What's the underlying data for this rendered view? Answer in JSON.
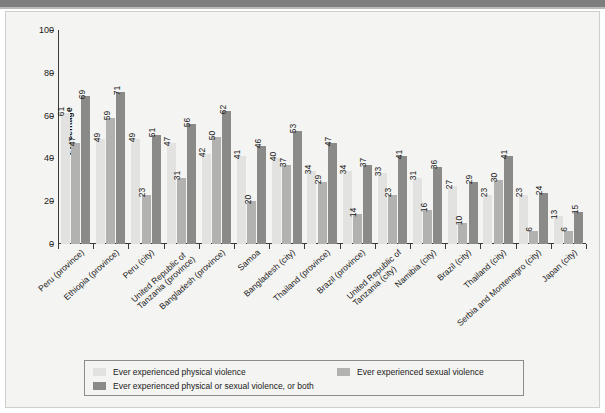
{
  "chart_data": {
    "type": "bar",
    "title": "",
    "subtitle": "",
    "xlabel": "",
    "ylabel": "Percentage",
    "ylim": [
      0,
      100
    ],
    "yticks": [
      0,
      20,
      40,
      60,
      80,
      100
    ],
    "grid": false,
    "legend_position": "bottom",
    "categories": [
      "Peru (province)",
      "Ethiopia (province)",
      "Peru (city)",
      "United Republic of\nTanzania (province)",
      "Bangladesh (province)",
      "Samoa",
      "Bangladesh (city)",
      "Thailand (province)",
      "Brazil (province)",
      "United Republic of\nTanzania (city)",
      "Namibia (city)",
      "Brazil (city)",
      "Thailand (city)",
      "Serbia and Montenegro (city)",
      "Japan (city)"
    ],
    "series": [
      {
        "name": "Ever experienced physical violence",
        "color": "#e2e2e0",
        "values": [
          61,
          49,
          49,
          47,
          42,
          41,
          40,
          34,
          34,
          33,
          31,
          27,
          23,
          23,
          13
        ]
      },
      {
        "name": "Ever experienced sexual violence",
        "color": "#b2b2b0",
        "values": [
          47,
          59,
          23,
          31,
          50,
          20,
          37,
          29,
          14,
          23,
          16,
          10,
          30,
          6,
          6
        ]
      },
      {
        "name": "Ever experienced physical or sexual violence, or both",
        "color": "#8a8a88",
        "values": [
          69,
          71,
          51,
          56,
          62,
          46,
          53,
          47,
          37,
          41,
          36,
          29,
          41,
          24,
          15
        ]
      }
    ]
  },
  "axis": {
    "y_title": "Percentage",
    "y_tick_labels": [
      "100",
      "80",
      "60",
      "40",
      "20",
      "0"
    ]
  },
  "legend": {
    "items": [
      {
        "label": "Ever experienced physical violence",
        "color": "#e2e2e0"
      },
      {
        "label": "Ever experienced sexual violence",
        "color": "#b2b2b0"
      },
      {
        "label": "Ever experienced physical or sexual violence, or both",
        "color": "#8a8a88"
      }
    ]
  },
  "colors": {
    "panel_background": "#f4f4f2",
    "page_background": "#ffffff",
    "top_strip": "#7e7e7e",
    "axis": "#3a3a3a",
    "text": "#1a1a1a"
  }
}
